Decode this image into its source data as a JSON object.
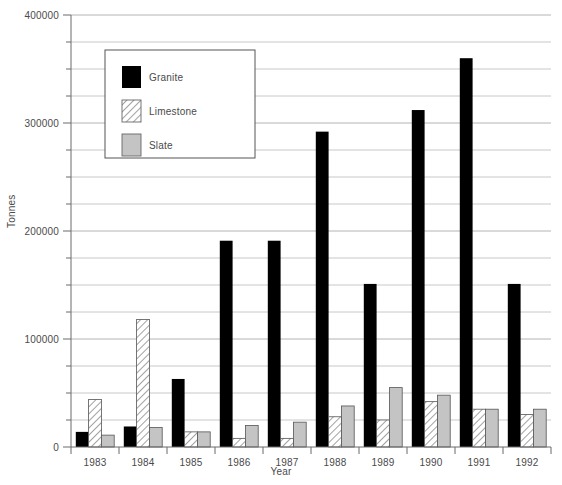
{
  "chart_data": {
    "type": "bar",
    "title": "",
    "xlabel": "Year",
    "ylabel": "Tonnes",
    "categories": [
      "1983",
      "1984",
      "1985",
      "1986",
      "1987",
      "1988",
      "1989",
      "1990",
      "1991",
      "1992"
    ],
    "series": [
      {
        "name": "Granite",
        "color": "#000000",
        "fill": "solid",
        "values": [
          14000,
          19000,
          63000,
          191000,
          191000,
          292000,
          151000,
          312000,
          360000,
          151000
        ]
      },
      {
        "name": "Limestone",
        "color": "#ffffff",
        "fill": "hatch",
        "values": [
          44000,
          118000,
          14000,
          8000,
          8000,
          28000,
          25000,
          42000,
          35000,
          30000
        ]
      },
      {
        "name": "Slate",
        "color": "#c4c4c4",
        "fill": "solid",
        "values": [
          11000,
          18000,
          14000,
          20000,
          23000,
          38000,
          55000,
          48000,
          35000,
          35000
        ]
      }
    ],
    "ylim": [
      0,
      400000
    ],
    "ytick_labels": [
      "0",
      "100000",
      "200000",
      "300000",
      "400000"
    ],
    "ytick_values": [
      0,
      100000,
      200000,
      300000,
      400000
    ],
    "yminor_step": 25000,
    "grid": true,
    "legend_position": "top-left",
    "legend_entries": [
      "Granite",
      "Limestone",
      "Slate"
    ]
  },
  "legend": {
    "items": [
      {
        "label": "Granite"
      },
      {
        "label": "Limestone"
      },
      {
        "label": "Slate"
      }
    ]
  },
  "axes": {
    "y_title": "Tonnes",
    "x_title": "Year"
  }
}
